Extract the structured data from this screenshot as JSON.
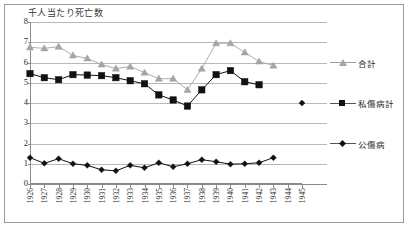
{
  "chart_data": {
    "type": "line",
    "title": "千人当たり死亡数",
    "xlabel": "",
    "ylabel": "千人当たり死亡数",
    "ylim": [
      0,
      8
    ],
    "ytick_values": [
      0,
      1,
      2,
      3,
      4,
      5,
      6,
      7,
      8
    ],
    "grid": true,
    "legend_position": "right",
    "categories": [
      "1926",
      "1927",
      "1928",
      "1929",
      "1930",
      "1931",
      "1932",
      "1933",
      "1934",
      "1935",
      "1936",
      "1937",
      "1938",
      "1939",
      "1940",
      "1941",
      "1942",
      "1943",
      "1944",
      "1945"
    ],
    "series": [
      {
        "name": "合計",
        "marker": "triangle",
        "color": "#a5a5a5",
        "values": [
          6.75,
          6.7,
          6.78,
          6.35,
          6.2,
          5.9,
          5.7,
          5.8,
          5.5,
          5.2,
          5.2,
          4.65,
          5.7,
          6.95,
          6.95,
          6.5,
          6.05,
          5.85,
          null,
          null
        ]
      },
      {
        "name": "私傷病計",
        "marker": "square",
        "color": "#111111",
        "values": [
          5.45,
          5.25,
          5.15,
          5.4,
          5.38,
          5.35,
          5.25,
          5.1,
          4.95,
          4.4,
          4.15,
          3.85,
          4.65,
          5.4,
          5.6,
          5.05,
          4.9,
          null,
          null,
          null
        ]
      },
      {
        "name": "公傷病",
        "marker": "diamond",
        "color": "#111111",
        "values": [
          1.3,
          1.02,
          1.25,
          1.0,
          0.92,
          0.7,
          0.65,
          0.92,
          0.8,
          1.05,
          0.85,
          1.0,
          1.2,
          1.1,
          0.98,
          1.0,
          1.05,
          1.3,
          null,
          4.0
        ]
      }
    ],
    "legend_entries": [
      "合計",
      "私傷病計",
      "公傷病"
    ]
  },
  "legend": {
    "items": [
      {
        "label": "合計"
      },
      {
        "label": "私傷病計"
      },
      {
        "label": "公傷病"
      }
    ]
  },
  "axis": {
    "y_title": "千人当たり死亡数",
    "y_labels": [
      "8",
      "7",
      "6",
      "5",
      "4",
      "3",
      "2",
      "1",
      "0"
    ],
    "x_labels": [
      "1926",
      "1927",
      "1928",
      "1929",
      "1930",
      "1931",
      "1932",
      "1933",
      "1934",
      "1935",
      "1936",
      "1937",
      "1938",
      "1939",
      "1940",
      "1941",
      "1942",
      "1943",
      "1944",
      "1945"
    ]
  },
  "colors": {
    "series_total": "#a5a5a5",
    "series_private": "#111111",
    "series_public": "#111111",
    "gridline": "#b8b8b8",
    "axis": "#8a8a8a",
    "border": "#9a9a9a",
    "background": "#ffffff"
  }
}
